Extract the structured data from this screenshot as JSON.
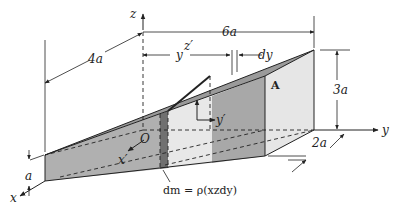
{
  "figure": {
    "type": "3D wedge centroid/mass element diagram",
    "axes": {
      "x": "x",
      "y": "y",
      "z": "z",
      "x_prime": "x′",
      "y_prime": "y′",
      "z_prime": "z′",
      "origin": "O"
    },
    "dimensions": {
      "length_total": "6a",
      "depth": "4a",
      "height_end": "3a",
      "width_end": "2a",
      "height_front": "a",
      "position": "y",
      "thickness": "dy"
    },
    "point_label": "A",
    "mass_element": "dm = ρ(xzdy)",
    "colors": {
      "face_dark": "#8e8e8e",
      "face_mid": "#b4b4b4",
      "face_light": "#e4e4e4",
      "slice": "#6e6e6e",
      "line": "#222222"
    }
  }
}
